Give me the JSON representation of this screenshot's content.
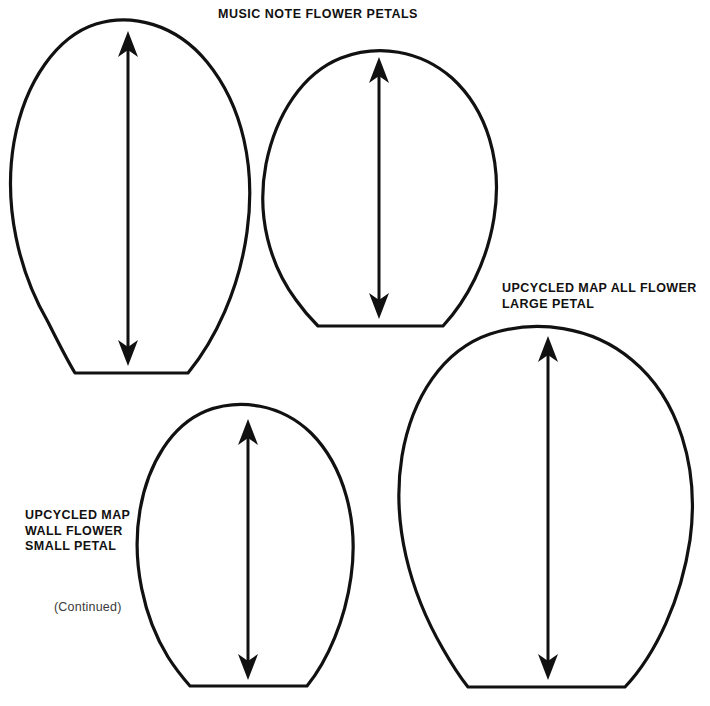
{
  "page": {
    "title": "MUSIC NOTE FLOWER PETALS",
    "background_color": "#ffffff",
    "ink_color": "#111111",
    "width": 710,
    "height": 706
  },
  "labels": {
    "title": "MUSIC NOTE FLOWER PETALS",
    "large_petal": "UPCYCLED MAP ALL FLOWER\nLARGE PETAL",
    "small_petal": "UPCYCLED MAP\nWALL FLOWER\nSMALL PETAL",
    "continued": "(Continued)"
  },
  "templates": [
    {
      "id": "petal-1",
      "name": "music-note-flower-petal-tall",
      "label_ref": "title",
      "grain_arrow": {
        "x": 128,
        "top_y": 33,
        "bottom_y": 364,
        "direction": "double"
      }
    },
    {
      "id": "petal-2",
      "name": "music-note-flower-petal-round",
      "label_ref": "title",
      "grain_arrow": {
        "x": 379,
        "top_y": 59,
        "bottom_y": 317,
        "direction": "double"
      }
    },
    {
      "id": "petal-3",
      "name": "upcycled-map-wall-flower-small-petal",
      "label_ref": "small_petal",
      "grain_arrow": {
        "x": 248,
        "top_y": 421,
        "bottom_y": 678,
        "direction": "double"
      }
    },
    {
      "id": "petal-4",
      "name": "upcycled-map-all-flower-large-petal",
      "label_ref": "large_petal",
      "grain_arrow": {
        "x": 548,
        "top_y": 338,
        "bottom_y": 678,
        "direction": "double"
      }
    }
  ]
}
